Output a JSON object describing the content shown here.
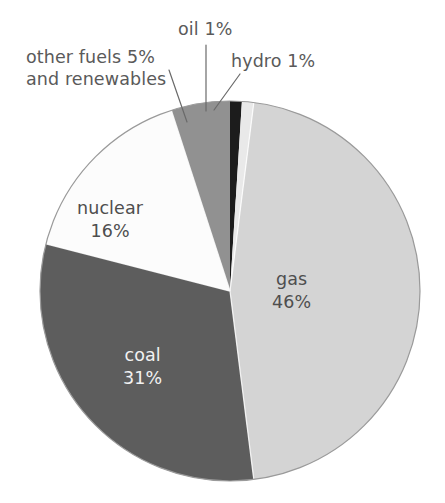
{
  "chart_data": {
    "type": "pie",
    "title": "",
    "subtitle": "",
    "xlabel": "",
    "ylabel": "",
    "legend_position": "none",
    "grid": false,
    "units": "percent",
    "total": 100,
    "start_angle_deg": 0,
    "direction": "clockwise",
    "categories": [
      "oil",
      "hydro",
      "gas",
      "coal",
      "nuclear",
      "other fuels and renewables"
    ],
    "values": [
      1,
      1,
      46,
      31,
      16,
      5
    ],
    "slices": [
      {
        "name": "oil",
        "label": "oil 1%",
        "label_name": "oil",
        "label_value": "1%",
        "value": 1,
        "color": "#1c1c1c",
        "label_placement": "outside",
        "has_leader_line": true
      },
      {
        "name": "hydro",
        "label": "hydro 1%",
        "label_name": "hydro",
        "label_value": "1%",
        "value": 1,
        "color": "#e9e9e9",
        "label_placement": "outside",
        "has_leader_line": true
      },
      {
        "name": "gas",
        "label": "gas 46%",
        "label_name": "gas",
        "label_value": "46%",
        "value": 46,
        "color": "#d4d4d4",
        "label_placement": "inside",
        "has_leader_line": false
      },
      {
        "name": "coal",
        "label": "coal 31%",
        "label_name": "coal",
        "label_value": "31%",
        "value": 31,
        "color": "#5d5d5d",
        "label_placement": "inside",
        "has_leader_line": false
      },
      {
        "name": "nuclear",
        "label": "nuclear 16%",
        "label_name": "nuclear",
        "label_value": "16%",
        "value": 16,
        "color": "#fcfcfc",
        "label_placement": "inside",
        "has_leader_line": false
      },
      {
        "name": "other fuels and renewables",
        "label": "other fuels 5% and renewables",
        "label_name": "other fuels 5%",
        "label_line2": "and renewables",
        "label_value": "5%",
        "value": 5,
        "color": "#919191",
        "label_placement": "outside",
        "has_leader_line": true
      }
    ],
    "palette": {
      "oil": "#1c1c1c",
      "hydro": "#e9e9e9",
      "gas": "#d4d4d4",
      "coal": "#5d5d5d",
      "nuclear": "#fcfcfc",
      "other_fuels": "#919191",
      "outline": "#9a9a9a",
      "separator": "#ffffff",
      "text_dark": "#5a5a5a",
      "text_light": "#f2f2f2",
      "background": "#ffffff"
    }
  }
}
